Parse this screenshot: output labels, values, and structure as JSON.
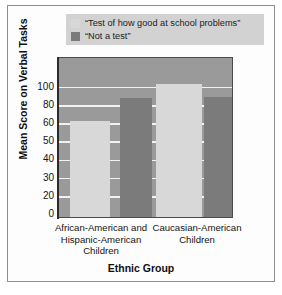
{
  "chart_data": {
    "type": "bar",
    "title": "",
    "xlabel": "Ethnic Group",
    "ylabel": "Mean Score on Verbal Tasks",
    "categories": [
      "African-American and Hispanic-American Children",
      "Caucasian-American Children"
    ],
    "series": [
      {
        "name": "“Test of how good at school problems”",
        "color": "#d8d8d8",
        "values": [
          61,
          102
        ]
      },
      {
        "name": "“Not a test”",
        "color": "#7b7b7b",
        "values": [
          86,
          88
        ]
      }
    ],
    "ylim": [
      0,
      110
    ],
    "yticks": [
      0,
      20,
      30,
      40,
      50,
      60,
      80,
      100
    ],
    "ytick_labels": [
      "0",
      "20",
      "30",
      "40",
      "50",
      "60",
      "80",
      "100"
    ],
    "grid": true,
    "legend_position": "top",
    "plot_background": "#9a9a9a",
    "gridline_color": "#f2f2f2"
  },
  "legend": {
    "items": [
      {
        "label": "“Test of how good at school problems”",
        "color": "#d8d8d8"
      },
      {
        "label": "“Not a test”",
        "color": "#7b7b7b"
      }
    ],
    "background": "#d2d2d2"
  },
  "axes": {
    "y_title": "Mean Score on Verbal Tasks",
    "x_title": "Ethnic Group",
    "y_tick_labels": [
      "100",
      "80",
      "60",
      "50",
      "40",
      "30",
      "20",
      "0"
    ],
    "x_category_lines": [
      [
        "African-American and",
        "Hispanic-American",
        "Children"
      ],
      [
        "Caucasian-American",
        "Children"
      ]
    ]
  }
}
